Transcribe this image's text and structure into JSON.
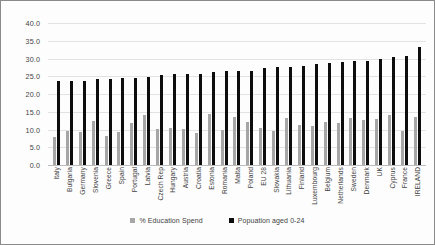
{
  "chart_data": {
    "type": "bar",
    "title": "",
    "xlabel": "",
    "ylabel": "",
    "ylim": [
      0,
      40
    ],
    "ytick_step": 5,
    "yticks": [
      "0.0",
      "5.0",
      "10.0",
      "15.0",
      "20.0",
      "25.0",
      "30.0",
      "35.0",
      "40.0"
    ],
    "grid": true,
    "legend_position": "bottom",
    "categories": [
      "Italy",
      "Bulgaria",
      "Germany",
      "Slovenia",
      "Greece",
      "Spain",
      "Portugal",
      "Latvia",
      "Czech Rep",
      "Hungary",
      "Austria",
      "Croatia",
      "Estonia",
      "Romania",
      "Malta",
      "Poland",
      "EU 28",
      "Slovakia",
      "Lithuania",
      "Finland",
      "Luxembourg",
      "Belgium",
      "Netherlands",
      "Sweden",
      "Denmark",
      "UK",
      "Cyprus",
      "France",
      "IRELAND"
    ],
    "series": [
      {
        "name": "% Education Spend",
        "color": "#a6a6a6",
        "values": [
          7.9,
          9.7,
          9.4,
          12.3,
          8.2,
          9.4,
          11.7,
          14.0,
          10.2,
          10.5,
          10.1,
          9.1,
          14.3,
          10.0,
          13.4,
          12.1,
          10.4,
          9.6,
          13.2,
          11.2,
          11.0,
          12.1,
          11.9,
          13.2,
          12.7,
          13.1,
          14.0,
          9.6,
          13.6
        ]
      },
      {
        "name": "Popuation aged 0-24",
        "color": "#0d0d0d",
        "values": [
          23.6,
          23.6,
          23.8,
          24.3,
          24.3,
          24.5,
          24.5,
          24.9,
          25.3,
          25.5,
          25.6,
          25.7,
          26.1,
          26.4,
          26.5,
          26.6,
          27.3,
          27.5,
          27.6,
          27.8,
          28.4,
          28.7,
          28.9,
          29.3,
          29.4,
          30.0,
          30.4,
          30.6,
          33.2
        ]
      }
    ]
  },
  "legend": {
    "entries": [
      {
        "label": "% Education Spend",
        "swatch": "edu"
      },
      {
        "label": "Popuation aged 0-24",
        "swatch": "pop"
      }
    ]
  }
}
